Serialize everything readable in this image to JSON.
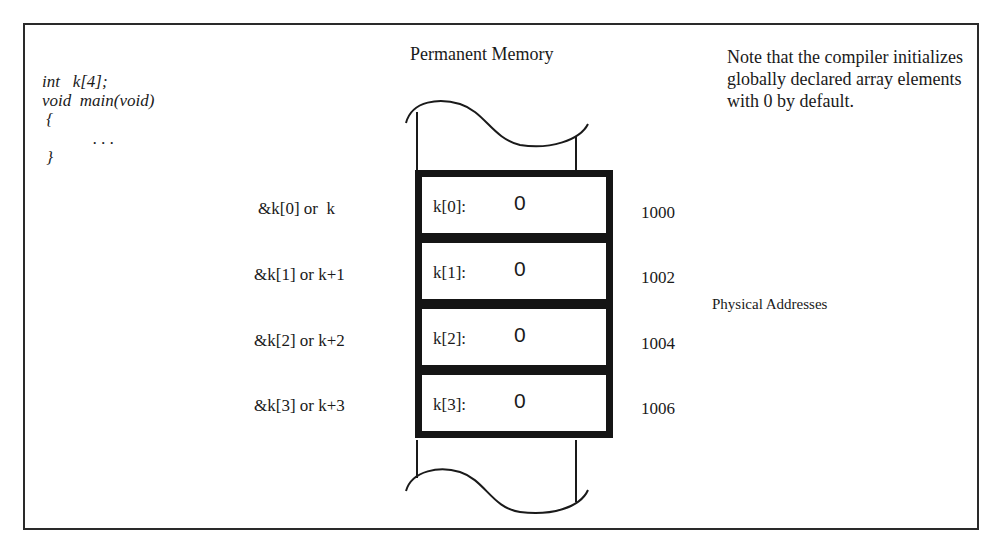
{
  "diagram": {
    "title": "Permanent Memory",
    "code": {
      "lines": [
        "int   k[4];",
        "void  main(void)",
        " {",
        "            . . .",
        " }"
      ]
    },
    "note": "Note that the compiler initializes globally declared array elements with 0 by default.",
    "physical_addresses_label": "Physical Addresses",
    "cells": [
      {
        "pointer": "&k[0] or  k",
        "label": "k[0]:",
        "value": "0",
        "address": "1000"
      },
      {
        "pointer": "&k[1] or k+1",
        "label": "k[1]:",
        "value": "0",
        "address": "1002"
      },
      {
        "pointer": "&k[2] or k+2",
        "label": "k[2]:",
        "value": "0",
        "address": "1004"
      },
      {
        "pointer": "&k[3] or k+3",
        "label": "k[3]:",
        "value": "0",
        "address": "1006"
      }
    ]
  }
}
